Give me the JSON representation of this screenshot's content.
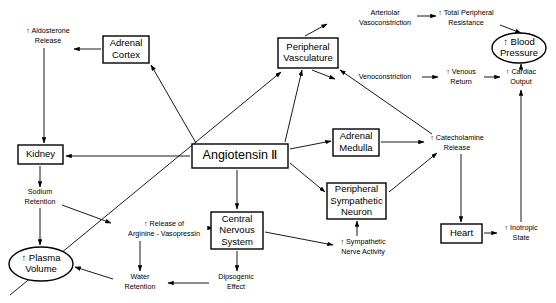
{
  "diagram": {
    "stroke_color": "#000000",
    "background_color": "#ffffff",
    "nodes": [
      {
        "id": "aldosterone",
        "label_lines": [
          "↑ Aldosterone",
          "Release"
        ],
        "shape": "text",
        "cx": 48,
        "cy": 36
      },
      {
        "id": "adrenal_cortex",
        "label_lines": [
          "Adrenal",
          "Cortex"
        ],
        "shape": "box",
        "x": 103,
        "y": 36,
        "w": 46,
        "h": 27
      },
      {
        "id": "kidney",
        "label_lines": [
          "Kidney"
        ],
        "shape": "box",
        "x": 18,
        "y": 145,
        "w": 45,
        "h": 19
      },
      {
        "id": "sodium_retention",
        "label_lines": [
          "Sodium",
          "Retention"
        ],
        "shape": "text",
        "cx": 40,
        "cy": 197
      },
      {
        "id": "plasma_volume",
        "label_lines": [
          "↑ Plasma",
          "Volume"
        ],
        "shape": "ellipse",
        "cx": 41,
        "cy": 264,
        "rx": 32,
        "ry": 17
      },
      {
        "id": "arginine_vaso",
        "label_lines": [
          "↑ Release of",
          "Arginine - Vasopressin"
        ],
        "shape": "text",
        "cx": 164,
        "cy": 229
      },
      {
        "id": "water_retention",
        "label_lines": [
          "Water",
          "Retention"
        ],
        "shape": "text",
        "cx": 140,
        "cy": 282
      },
      {
        "id": "dipsogenic",
        "label_lines": [
          "Dipsogenic",
          "Effect"
        ],
        "shape": "text",
        "cx": 236,
        "cy": 282
      },
      {
        "id": "angiotensin_ii",
        "label_lines": [
          "Angiotensin Ⅱ"
        ],
        "shape": "box",
        "x": 192,
        "y": 144,
        "w": 96,
        "h": 24
      },
      {
        "id": "cns",
        "label_lines": [
          "Central",
          "Nervous",
          "System"
        ],
        "shape": "box",
        "x": 211,
        "y": 212,
        "w": 52,
        "h": 37
      },
      {
        "id": "sympathetic_act",
        "label_lines": [
          "↑ Sympathetic",
          "Nerve Activity"
        ],
        "shape": "text",
        "cx": 363,
        "cy": 247
      },
      {
        "id": "peripheral_vasc",
        "label_lines": [
          "Peripheral",
          "Vasculature"
        ],
        "shape": "box",
        "x": 278,
        "y": 38,
        "w": 60,
        "h": 30
      },
      {
        "id": "adrenal_medulla",
        "label_lines": [
          "Adrenal",
          "Medulla"
        ],
        "shape": "box",
        "x": 333,
        "y": 129,
        "w": 46,
        "h": 27
      },
      {
        "id": "periph_symp_neuron",
        "label_lines": [
          "Peripheral",
          "Sympathetic",
          "Neuron"
        ],
        "shape": "box",
        "x": 327,
        "y": 183,
        "w": 59,
        "h": 36
      },
      {
        "id": "arteriolar_vaso",
        "label_lines": [
          "Arteriolar",
          "Vasoconstriction"
        ],
        "shape": "text",
        "cx": 385,
        "cy": 18
      },
      {
        "id": "venoconstriction",
        "label_lines": [
          "Venoconstriction"
        ],
        "shape": "text",
        "cx": 385,
        "cy": 77
      },
      {
        "id": "total_periph_res",
        "label_lines": [
          "↑ Total Peripheral",
          "Resistance"
        ],
        "shape": "text",
        "cx": 466,
        "cy": 18
      },
      {
        "id": "venous_return",
        "label_lines": [
          "↑ Venous",
          "Return"
        ],
        "shape": "text",
        "cx": 461,
        "cy": 77
      },
      {
        "id": "cardiac_output",
        "label_lines": [
          "↑ Cardiac",
          "Output"
        ],
        "shape": "text",
        "cx": 521,
        "cy": 77
      },
      {
        "id": "blood_pressure",
        "label_lines": [
          "↑ Blood",
          "Pressure"
        ],
        "shape": "ellipse",
        "cx": 519,
        "cy": 48,
        "rx": 27,
        "ry": 15
      },
      {
        "id": "catecholamine",
        "label_lines": [
          "↑ Catecholamine",
          "Release"
        ],
        "shape": "text",
        "cx": 457,
        "cy": 143
      },
      {
        "id": "heart",
        "label_lines": [
          "Heart"
        ],
        "shape": "box",
        "x": 441,
        "y": 224,
        "w": 41,
        "h": 19
      },
      {
        "id": "inotropic_state",
        "label_lines": [
          "↑ Inotropic",
          "State"
        ],
        "shape": "text",
        "cx": 521,
        "cy": 233
      }
    ],
    "edges": [
      {
        "from": "adrenal_cortex",
        "to": "aldosterone",
        "path": "M 101 49 L 74 49"
      },
      {
        "from": "aldosterone",
        "to": "kidney",
        "path": "M 44 48 L 44 143"
      },
      {
        "from": "angiotensin_ii",
        "to": "adrenal_cortex",
        "path": "M 196 143 L 151 65"
      },
      {
        "from": "angiotensin_ii",
        "to": "kidney",
        "path": "M 190 156 L 66 156"
      },
      {
        "from": "kidney",
        "to": "sodium_retention",
        "path": "M 40 166 L 40 187"
      },
      {
        "from": "sodium_retention",
        "to": "plasma_volume",
        "path": "M 40 208 L 40 245"
      },
      {
        "from": "sodium_retention",
        "to": "arginine_vaso",
        "path": "M 62 205 L 111 223"
      },
      {
        "from": "angiotensin_ii",
        "to": "cns",
        "path": "M 237 170 L 237 209"
      },
      {
        "from": "cns",
        "to": "arginine_vaso",
        "path": "M 209 228 L 213 228"
      },
      {
        "from": "arginine_vaso",
        "to": "water_retention",
        "path": "M 140 241 L 140 271"
      },
      {
        "from": "cns",
        "to": "dipsogenic",
        "path": "M 237 251 L 237 271"
      },
      {
        "from": "dipsogenic",
        "to": "water_retention",
        "path": "M 209 283 L 168 283"
      },
      {
        "from": "water_retention",
        "to": "plasma_volume",
        "path": "M 113 279 L 75 267"
      },
      {
        "from": "cns",
        "to": "sympathetic_act",
        "path": "M 265 232 L 333 245"
      },
      {
        "from": "sympathetic_act",
        "to": "periph_symp_neuron",
        "path": "M 357 236 L 357 221"
      },
      {
        "from": "angiotensin_ii",
        "to": "peripheral_vasc",
        "path": "M 285 142 L 302 70"
      },
      {
        "from": "angiotensin_ii",
        "to": "adrenal_medulla",
        "path": "M 290 149 L 331 141"
      },
      {
        "from": "angiotensin_ii",
        "to": "periph_symp_neuron",
        "path": "M 290 163 L 325 192"
      },
      {
        "from": "peripheral_vasc",
        "to": "arteriolar_vaso",
        "path": "M 305 36 L 327 24"
      },
      {
        "from": "peripheral_vasc",
        "to": "venoconstriction",
        "path": "M 312 70 L 335 79"
      },
      {
        "from": "arteriolar_vaso",
        "to": "total_periph_res",
        "path": "M 417 16 L 436 16"
      },
      {
        "from": "venoconstriction",
        "to": "venous_return",
        "path": "M 422 77 L 438 77"
      },
      {
        "from": "venous_return",
        "to": "cardiac_output",
        "path": "M 484 77 L 500 77"
      },
      {
        "from": "total_periph_res",
        "to": "blood_pressure",
        "path": "M 500 25 L 521 33"
      },
      {
        "from": "cardiac_output",
        "to": "blood_pressure",
        "path": "M 521 67 L 521 64"
      },
      {
        "from": "adrenal_medulla",
        "to": "catecholamine",
        "path": "M 381 142 L 424 142"
      },
      {
        "from": "periph_symp_neuron",
        "to": "catecholamine",
        "path": "M 389 192 L 437 153"
      },
      {
        "from": "catecholamine",
        "to": "heart",
        "path": "M 461 154 L 461 222"
      },
      {
        "from": "heart",
        "to": "inotropic_state",
        "path": "M 484 233 L 497 233"
      },
      {
        "from": "inotropic_state",
        "to": "cardiac_output",
        "path": "M 521 222 L 521 90"
      },
      {
        "from": "catecholamine",
        "to": "peripheral_vasc",
        "path": "M 432 134 L 340 70"
      },
      {
        "from": "plasma_volume_src",
        "to": "peripheral_vasc",
        "path": "M 10 295 L 281 72"
      }
    ]
  }
}
